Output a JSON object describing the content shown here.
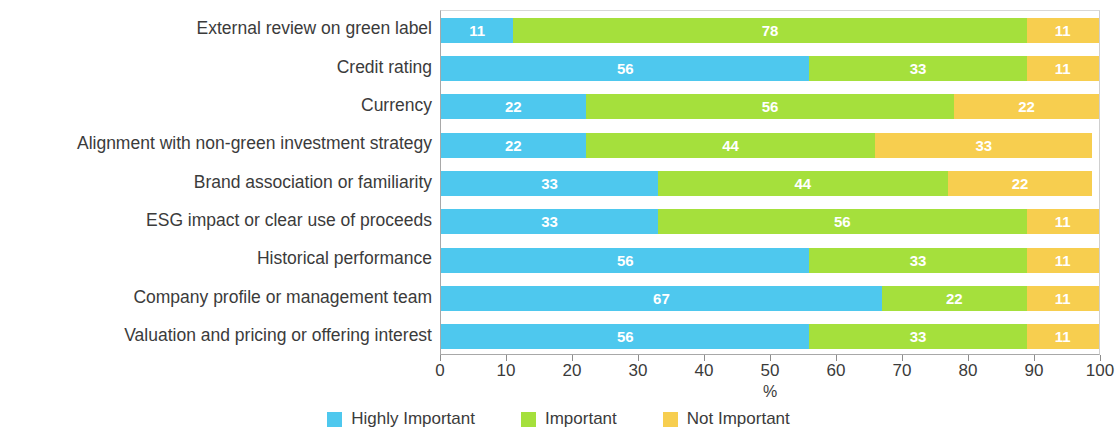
{
  "chart_data": {
    "type": "bar",
    "orientation": "horizontal",
    "stacked": true,
    "stack_total": 100,
    "title": "",
    "xlabel": "%",
    "ylabel": "",
    "xlim": [
      0,
      100
    ],
    "xticks": [
      0,
      10,
      20,
      30,
      40,
      50,
      60,
      70,
      80,
      90,
      100
    ],
    "xtick_labels": [
      "0",
      "10",
      "20",
      "30",
      "40",
      "50",
      "60",
      "70",
      "80",
      "90",
      "100"
    ],
    "grid": false,
    "legend_position": "bottom",
    "categories": [
      "External review on green label",
      "Credit rating",
      "Currency",
      "Alignment with non-green investment strategy",
      "Brand association or familiarity",
      "ESG impact or clear use of proceeds",
      "Historical performance",
      "Company profile or management team",
      "Valuation and pricing or offering interest"
    ],
    "series": [
      {
        "name": "Highly Important",
        "color": "#4EC8EE",
        "values": [
          11,
          56,
          22,
          22,
          33,
          33,
          56,
          67,
          56
        ]
      },
      {
        "name": "Important",
        "color": "#A5E03C",
        "values": [
          78,
          33,
          56,
          44,
          44,
          56,
          33,
          22,
          33
        ]
      },
      {
        "name": "Not Important",
        "color": "#F7CE4F",
        "values": [
          11,
          11,
          22,
          33,
          22,
          11,
          11,
          11,
          11
        ]
      }
    ]
  }
}
